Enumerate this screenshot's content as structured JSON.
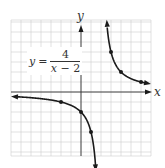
{
  "chart_data": {
    "type": "line",
    "title": "",
    "equation": {
      "lhs": "y",
      "equals": "=",
      "numerator": "4",
      "denominator_var": "x",
      "denominator_rest": " − 2"
    },
    "xlabel": "x",
    "ylabel": "y",
    "xlim": [
      -7,
      7
    ],
    "ylim": [
      -6.5,
      7
    ],
    "grid": true,
    "grid_step": 1,
    "asymptotes": {
      "vertical": 2,
      "horizontal": 0
    },
    "function": "4/(x-2)",
    "series": [
      {
        "name": "left branch (x < 2)",
        "x": [
          -7,
          -2,
          0,
          1,
          1.47
        ],
        "y": [
          -0.44,
          -1,
          -2,
          -4,
          -7.5
        ],
        "marked_points": [
          [
            -2,
            -1
          ],
          [
            0,
            -2
          ],
          [
            1,
            -4
          ]
        ],
        "arrows": [
          "left",
          "down"
        ]
      },
      {
        "name": "right branch (x > 2)",
        "x": [
          2.6,
          3,
          4,
          6,
          6.8
        ],
        "y": [
          6.7,
          4,
          2,
          1,
          0.83
        ],
        "marked_points": [
          [
            3,
            4
          ],
          [
            4,
            2
          ],
          [
            6,
            1
          ]
        ],
        "arrows": [
          "up",
          "right"
        ]
      }
    ]
  },
  "layout": {
    "origin_px": [
      81,
      92
    ],
    "unit_px": 10,
    "grid_x_range": [
      -7,
      7
    ],
    "grid_y_range": [
      -6,
      7
    ]
  },
  "axes": {
    "x_label": "x",
    "y_label": "y"
  }
}
